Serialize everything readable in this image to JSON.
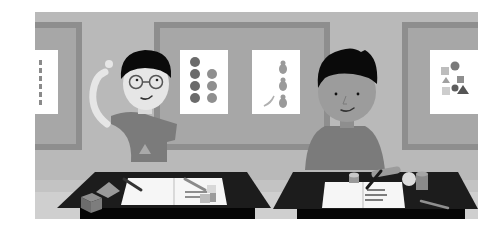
{
  "illustration": {
    "description": "Grayscale illustration of two children seated at black classroom desks in front of bulletin boards with posters",
    "colors": {
      "background": "#ffffff",
      "wall": "#b9b9b9",
      "floor": "#cfcfcf",
      "board_frame": "#8e8e8e",
      "board_cork": "#a7a7a7",
      "poster": "#ffffff",
      "desk": "#1c1c1c",
      "desk_front": "#050505",
      "hair": "#0a0a0a",
      "skin_left": "#e6e6e6",
      "skin_right": "#9c9c9c",
      "shirt": "#7b7b7b"
    },
    "boards": [
      {
        "name": "left-board",
        "poster": "vertical-dots-poster"
      },
      {
        "name": "center-board",
        "posters": [
          "circles-poster",
          "pears-poster"
        ]
      },
      {
        "name": "right-board",
        "poster": "shapes-poster"
      }
    ],
    "children": [
      {
        "name": "child-left",
        "features": [
          "glasses",
          "hand-on-head",
          "smile"
        ]
      },
      {
        "name": "child-right",
        "features": [
          "writing",
          "smile"
        ]
      }
    ],
    "desks": [
      {
        "name": "desk-left",
        "items": [
          "open-notebook",
          "pencil",
          "pen",
          "cube",
          "pyramid",
          "dice"
        ]
      },
      {
        "name": "desk-right",
        "items": [
          "open-notebook",
          "pencil",
          "tape-roll",
          "ball",
          "cup",
          "pen"
        ]
      }
    ]
  }
}
